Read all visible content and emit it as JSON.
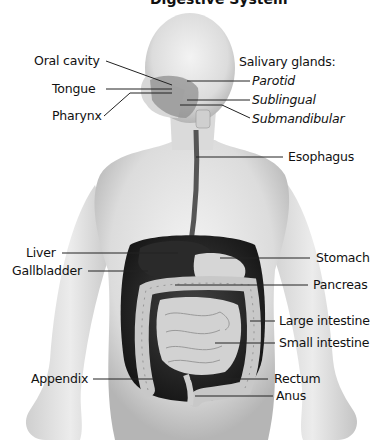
{
  "diagram": {
    "title_partial": "Digestive System",
    "labels_left": {
      "oral_cavity": "Oral cavity",
      "tongue": "Tongue",
      "pharynx": "Pharynx",
      "liver": "Liver",
      "gallbladder": "Gallbladder",
      "appendix": "Appendix"
    },
    "labels_right": {
      "salivary_header": "Salivary glands:",
      "parotid": "Parotid",
      "sublingual": "Sublingual",
      "submandibular": "Submandibular",
      "esophagus": "Esophagus",
      "stomach": "Stomach",
      "pancreas": "Pancreas",
      "large_intestine": "Large intestine",
      "small_intestine": "Small intestine",
      "rectum": "Rectum",
      "anus": "Anus"
    },
    "colors": {
      "skin_light": "#ececec",
      "skin_shade": "#b8b8b8",
      "organ_dark": "#1e1e1e",
      "intestine": "#c9c9c9",
      "line": "#222222"
    }
  }
}
